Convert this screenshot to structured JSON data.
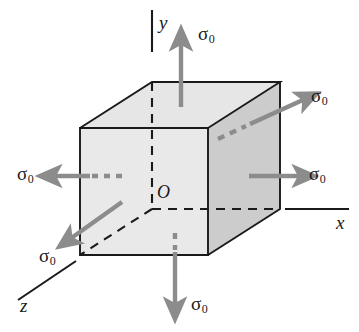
{
  "figure": {
    "background_color": "#ffffff",
    "cube": {
      "front_face_color": "#e9e9e9",
      "right_face_color": "#cfcfcf",
      "top_face_color": "#e2e2e2",
      "edge_color": "#1a1a1a",
      "hidden_edge_style": "dashed"
    },
    "arrow_color": "#8c8c8c",
    "axis_color": "#1a1a1a"
  },
  "axes": [
    {
      "name": "y-axis",
      "label": "y",
      "direction": "up"
    },
    {
      "name": "x-axis",
      "label": "x",
      "direction": "right"
    },
    {
      "name": "z-axis",
      "label": "z",
      "direction": "lower-left"
    }
  ],
  "origin": {
    "label": "O"
  },
  "stresses": [
    {
      "name": "stress-top",
      "symbol": "σ",
      "subscript": "0",
      "direction": "up"
    },
    {
      "name": "stress-bottom",
      "symbol": "σ",
      "subscript": "0",
      "direction": "down"
    },
    {
      "name": "stress-left",
      "symbol": "σ",
      "subscript": "0",
      "direction": "left"
    },
    {
      "name": "stress-right",
      "symbol": "σ",
      "subscript": "0",
      "direction": "right"
    },
    {
      "name": "stress-back-right",
      "symbol": "σ",
      "subscript": "0",
      "direction": "upper-right"
    },
    {
      "name": "stress-front-left",
      "symbol": "σ",
      "subscript": "0",
      "direction": "lower-left"
    }
  ]
}
